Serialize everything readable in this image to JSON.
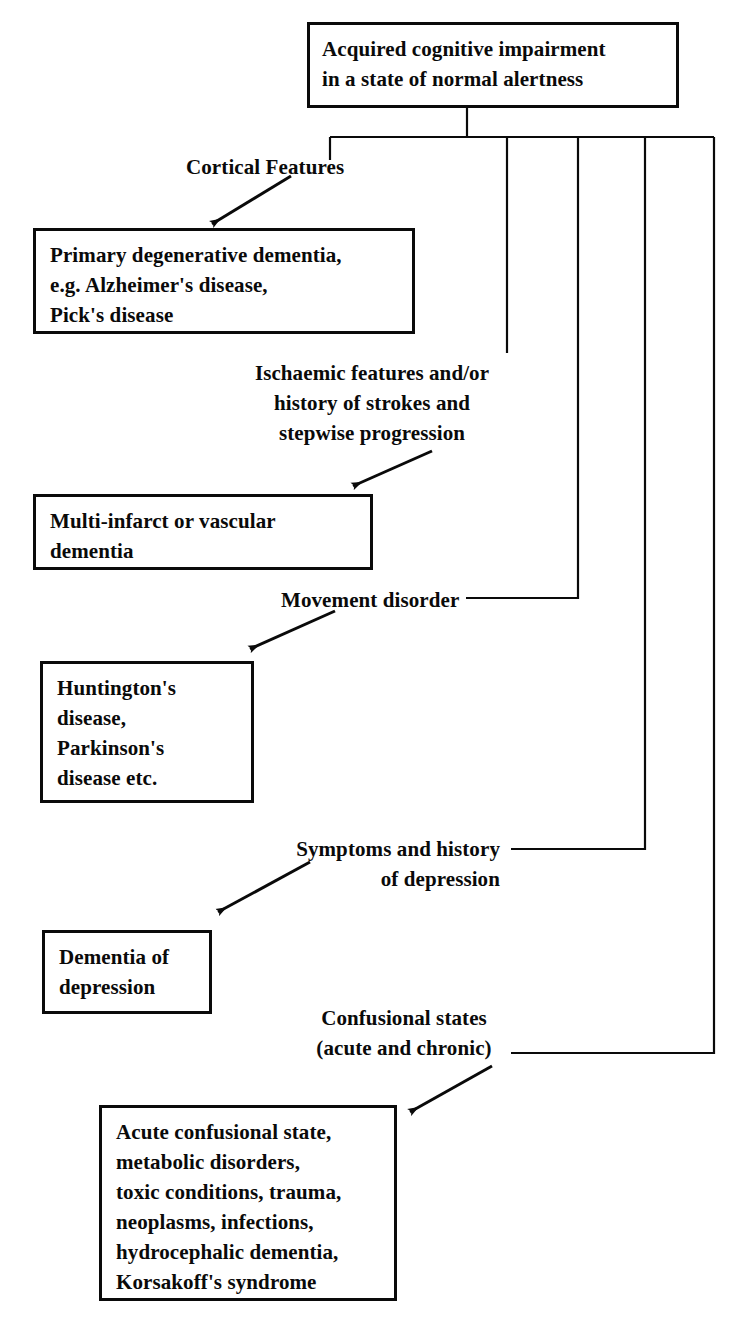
{
  "diagram": {
    "title": "Acquired cognitive impairment in a state of normal alertness",
    "type": "flowchart",
    "root": {
      "id": "root",
      "text": "Acquired cognitive impairment\nin a state of normal alertness"
    },
    "branches": [
      {
        "id": "branch-cortical",
        "label": "Cortical Features",
        "box": "Primary degenerative dementia,\ne.g. Alzheimer's disease,\nPick's disease"
      },
      {
        "id": "branch-ischaemic",
        "label": "Ischaemic features and/or\nhistory of strokes and\nstepwise progression",
        "box": "Multi-infarct or vascular\ndementia"
      },
      {
        "id": "branch-movement",
        "label": "Movement disorder",
        "box": "Huntington's\ndisease,\nParkinson's\ndisease etc."
      },
      {
        "id": "branch-depression",
        "label": "Symptoms and history\nof depression",
        "box": "Dementia of\ndepression"
      },
      {
        "id": "branch-confusional",
        "label": "Confusional states\n(acute and chronic)",
        "box": "Acute confusional state,\nmetabolic disorders,\ntoxic conditions, trauma,\nneoplasms, infections,\nhydrocephalic dementia,\nKorsakoff's syndrome"
      }
    ],
    "colors": {
      "ink": "#0a0a0a",
      "paper": "#ffffff"
    }
  }
}
